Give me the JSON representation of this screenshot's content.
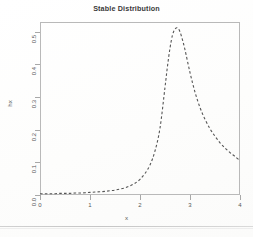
{
  "chart_data": {
    "type": "line",
    "title": "Stable Distribution",
    "xlabel": "x",
    "ylabel": "hx",
    "xlim": [
      0,
      4
    ],
    "ylim": [
      0,
      0.53
    ],
    "grid": false,
    "legend": null,
    "line_style": "dashed",
    "line_color": "#555555",
    "xticks": [
      "0",
      "1",
      "2",
      "3",
      "4"
    ],
    "xtick_values": [
      0,
      1,
      2,
      3,
      4
    ],
    "yticks": [
      "0.0",
      "0.1",
      "0.2",
      "0.3",
      "0.4",
      "0.5"
    ],
    "ytick_values": [
      0.0,
      0.1,
      0.2,
      0.3,
      0.4,
      0.5
    ],
    "series": [
      {
        "name": "hx",
        "x": [
          0.0,
          0.1,
          0.2,
          0.3,
          0.4,
          0.5,
          0.6,
          0.7,
          0.8,
          0.9,
          1.0,
          1.1,
          1.2,
          1.3,
          1.4,
          1.5,
          1.6,
          1.7,
          1.8,
          1.9,
          2.0,
          2.1,
          2.2,
          2.3,
          2.4,
          2.5,
          2.55,
          2.6,
          2.65,
          2.7,
          2.75,
          2.8,
          2.85,
          2.9,
          3.0,
          3.1,
          3.2,
          3.3,
          3.4,
          3.5,
          3.6,
          3.7,
          3.8,
          3.9,
          4.0
        ],
        "y": [
          0.004,
          0.004,
          0.004,
          0.004,
          0.005,
          0.005,
          0.005,
          0.006,
          0.006,
          0.007,
          0.008,
          0.009,
          0.01,
          0.011,
          0.013,
          0.015,
          0.018,
          0.022,
          0.028,
          0.036,
          0.048,
          0.066,
          0.092,
          0.135,
          0.205,
          0.33,
          0.395,
          0.45,
          0.49,
          0.508,
          0.512,
          0.5,
          0.475,
          0.445,
          0.375,
          0.315,
          0.268,
          0.232,
          0.203,
          0.18,
          0.16,
          0.144,
          0.13,
          0.118,
          0.105
        ]
      }
    ]
  }
}
